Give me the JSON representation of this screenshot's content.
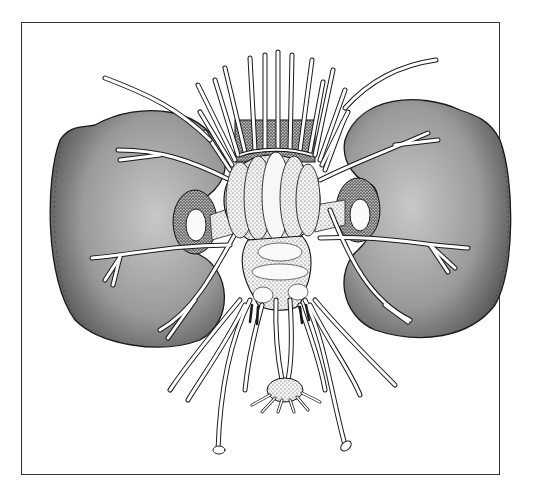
{
  "figure": {
    "type": "anatomical-illustration",
    "style": "stippled black-and-white drawing",
    "frame": {
      "x": 21,
      "y": 22,
      "width": 479,
      "height": 453,
      "border_color": "#333333"
    },
    "colors": {
      "lobe_fill_light": "#bdbdbd",
      "lobe_fill_dark": "#555555",
      "nerve_fill": "#ffffff",
      "outline": "#1a1a1a",
      "background": "#ffffff"
    },
    "parts": [
      {
        "name": "left-lateral-lobe",
        "bbox": [
          50,
          110,
          225,
          345
        ]
      },
      {
        "name": "right-lateral-lobe",
        "bbox": [
          338,
          95,
          508,
          335
        ]
      },
      {
        "name": "central-ganglion",
        "bbox": [
          222,
          150,
          320,
          240
        ]
      },
      {
        "name": "lower-ganglion-mass",
        "bbox": [
          250,
          240,
          315,
          320
        ]
      },
      {
        "name": "terminal-ganglion",
        "bbox": [
          265,
          375,
          305,
          410
        ]
      },
      {
        "name": "dorsal-nerve-bundle",
        "bbox": [
          200,
          50,
          340,
          150
        ]
      }
    ],
    "caption": ""
  }
}
